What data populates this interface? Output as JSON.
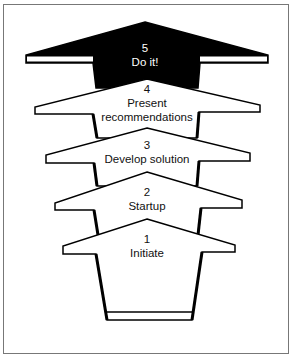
{
  "diagram": {
    "type": "stacked-arrow-process",
    "direction": "bottom-to-top",
    "steps": [
      {
        "number": "1",
        "label": "Initiate",
        "fill": "#ffffff"
      },
      {
        "number": "2",
        "label": "Startup",
        "fill": "#ffffff"
      },
      {
        "number": "3",
        "label": "Develop solution",
        "fill": "#ffffff"
      },
      {
        "number": "4",
        "label": "Present",
        "label2": "recommendations",
        "fill": "#ffffff"
      },
      {
        "number": "5",
        "label": "Do it!",
        "fill": "#000000"
      }
    ]
  }
}
